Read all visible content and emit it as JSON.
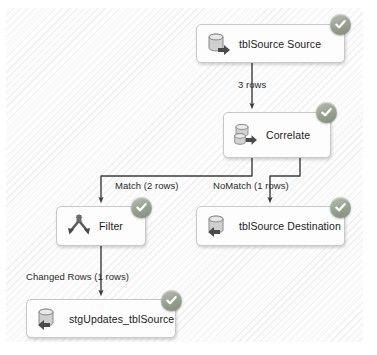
{
  "diagram": {
    "type": "data-flow",
    "nodes": [
      {
        "id": "source",
        "label": "tblSource Source",
        "icon": "database-source-icon",
        "status": "success-check-icon",
        "x": 196,
        "y": 24,
        "w": 149,
        "h": 39
      },
      {
        "id": "correlate",
        "label": "Correlate",
        "icon": "database-merge-icon",
        "status": "success-check-icon",
        "x": 223,
        "y": 112,
        "w": 108,
        "h": 46
      },
      {
        "id": "filter",
        "label": "Filter",
        "icon": "split-arrows-icon",
        "status": "success-check-icon",
        "x": 56,
        "y": 206,
        "w": 90,
        "h": 40
      },
      {
        "id": "destination",
        "label": "tblSource Destination",
        "icon": "database-destination-icon",
        "status": "success-check-icon",
        "x": 196,
        "y": 206,
        "w": 149,
        "h": 40
      },
      {
        "id": "staging",
        "label": "stgUpdates_tblSource",
        "icon": "database-destination-icon",
        "status": "success-check-icon",
        "x": 26,
        "y": 299,
        "w": 150,
        "h": 39
      }
    ],
    "edges": [
      {
        "id": "source-to-correlate",
        "label": "3 rows",
        "from": "source",
        "to": "correlate"
      },
      {
        "id": "correlate-to-filter",
        "label": "Match (2 rows)",
        "from": "correlate",
        "to": "filter"
      },
      {
        "id": "correlate-to-dest",
        "label": "NoMatch (1 rows)",
        "from": "correlate",
        "to": "destination"
      },
      {
        "id": "filter-to-staging",
        "label": "Changed Rows (1 rows)",
        "from": "filter",
        "to": "staging"
      }
    ]
  },
  "colors": {
    "canvas": "#fbfbfb",
    "node_fill": "#fdfdfd",
    "node_border": "#c8c8c8",
    "wire": "#3c3c3c",
    "badge": "#9fa79c",
    "text": "#1b1b1b"
  }
}
